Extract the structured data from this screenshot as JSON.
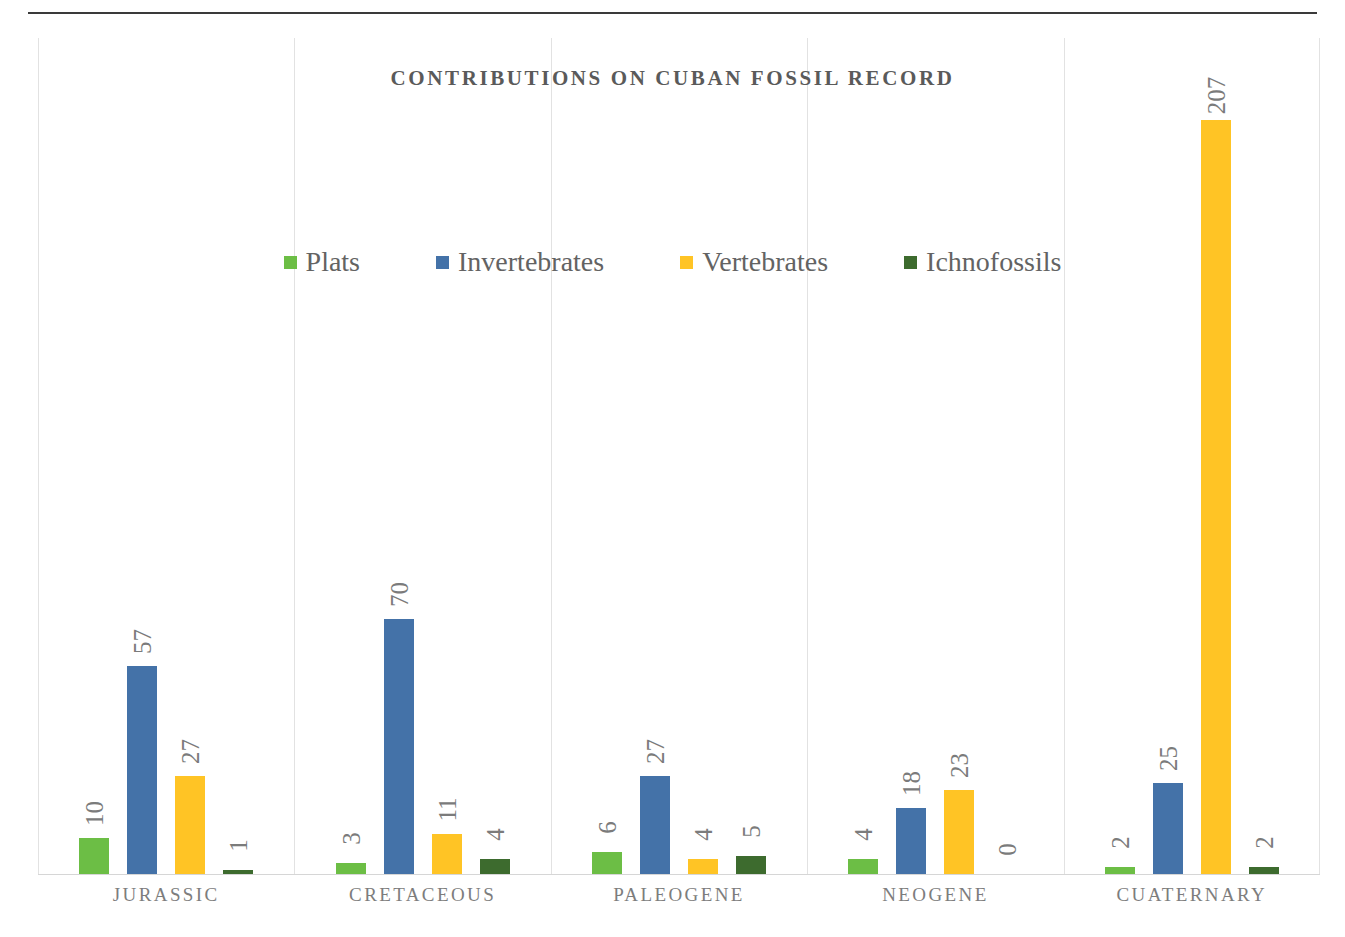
{
  "figure": {
    "title": "CONTRIBUTIONS ON CUBAN FOSSIL RECORD"
  },
  "legend": {
    "items": [
      {
        "label": "Plats",
        "color": "#6CBE45",
        "swatch_name": "legend-swatch-plats"
      },
      {
        "label": "Invertebrates",
        "color": "#4472A8",
        "swatch_name": "legend-swatch-invertebrates"
      },
      {
        "label": "Vertebrates",
        "color": "#FFC425",
        "swatch_name": "legend-swatch-vertebrates"
      },
      {
        "label": "Ichnofossils",
        "color": "#3D6B2E",
        "swatch_name": "legend-swatch-ichnofossils"
      }
    ]
  },
  "chart_data": {
    "type": "bar",
    "title": "CONTRIBUTIONS ON CUBAN FOSSIL RECORD",
    "xlabel": "",
    "ylabel": "",
    "grid": "vertical-category-separators",
    "legend_position": "top-center",
    "axis_visible": {
      "x": true,
      "y": false
    },
    "ylim": [
      0,
      229
    ],
    "categories": [
      "JURASSIC",
      "CRETACEOUS",
      "PALEOGENE",
      "NEOGENE",
      "CUATERNARY"
    ],
    "series": [
      {
        "name": "Plats",
        "color": "#6CBE45",
        "values": [
          10,
          3,
          6,
          4,
          2
        ]
      },
      {
        "name": "Invertebrates",
        "color": "#4472A8",
        "values": [
          57,
          70,
          27,
          18,
          25
        ]
      },
      {
        "name": "Vertebrates",
        "color": "#FFC425",
        "values": [
          27,
          11,
          4,
          23,
          207
        ]
      },
      {
        "name": "Ichnofossils",
        "color": "#3D6B2E",
        "values": [
          1,
          4,
          5,
          0,
          2
        ]
      }
    ],
    "data_labels": {
      "JURASSIC": [
        "10",
        "57",
        "27",
        "1"
      ],
      "CRETACEOUS": [
        "3",
        "70",
        "11",
        "4"
      ],
      "PALEOGENE": [
        "6",
        "27",
        "4",
        "5"
      ],
      "NEOGENE": [
        "4",
        "18",
        "23",
        "0"
      ],
      "CUATERNARY": [
        "2",
        "25",
        "207",
        "2"
      ]
    },
    "data_label_rotation": -90
  },
  "colors": {
    "plats": "#6CBE45",
    "invertebrates": "#4472A8",
    "vertebrates": "#FFC425",
    "ichnofossils": "#3D6B2E",
    "gridline": "#e2e2e2",
    "axis": "#d6d6d6",
    "title_text": "#5a5a5a",
    "label_text": "#7b7b7b",
    "category_text": "#7d7d7d",
    "top_rule": "#3a3a3a"
  }
}
